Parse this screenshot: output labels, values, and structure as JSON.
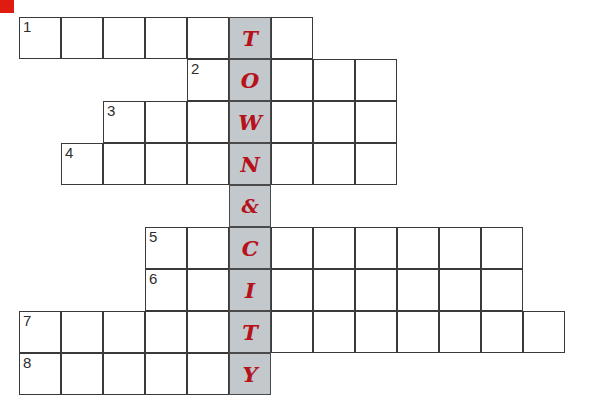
{
  "page": {
    "background_color": "#ffffff",
    "corner_mark_color": "#e01b10"
  },
  "grid": {
    "cell_size": 42,
    "origin_x": 19,
    "origin_y": 17,
    "total_rows": 9,
    "total_columns": 13,
    "highlight_column_index": 5,
    "highlight_color": "#c3c8cc",
    "border_color": "#3a3a3a",
    "letter_color": "#b5121b",
    "number_color": "#2e2e2e",
    "keyword": "TOWN & CITY",
    "keyword_letters": [
      "T",
      "O",
      "W",
      "N",
      "&",
      "C",
      "I",
      "T",
      "Y"
    ]
  },
  "rows": [
    {
      "number": "1",
      "row_index": 0,
      "start_col": 0,
      "length": 7,
      "highlight_letter": "T"
    },
    {
      "number": "2",
      "row_index": 1,
      "start_col": 4,
      "length": 5,
      "highlight_letter": "O"
    },
    {
      "number": "3",
      "row_index": 2,
      "start_col": 2,
      "length": 7,
      "highlight_letter": "W"
    },
    {
      "number": "4",
      "row_index": 3,
      "start_col": 1,
      "length": 8,
      "highlight_letter": "N"
    },
    {
      "number": "",
      "row_index": 4,
      "start_col": 5,
      "length": 1,
      "highlight_letter": "&"
    },
    {
      "number": "5",
      "row_index": 5,
      "start_col": 3,
      "length": 9,
      "highlight_letter": "C"
    },
    {
      "number": "6",
      "row_index": 6,
      "start_col": 3,
      "length": 9,
      "highlight_letter": "I"
    },
    {
      "number": "7",
      "row_index": 7,
      "start_col": 0,
      "length": 13,
      "highlight_letter": "T"
    },
    {
      "number": "8",
      "row_index": 8,
      "start_col": 0,
      "length": 6,
      "highlight_letter": "Y"
    }
  ]
}
